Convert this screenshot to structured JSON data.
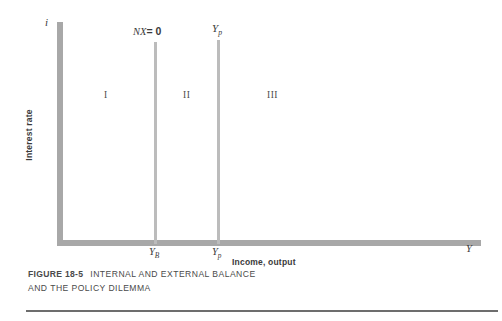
{
  "figure": {
    "number_label": "FIGURE 18-5",
    "caption_line1": "INTERNAL AND EXTERNAL BALANCE",
    "caption_line2": "AND THE POLICY DILEMMA"
  },
  "chart_data": {
    "type": "line",
    "title": "INTERNAL AND EXTERNAL BALANCE AND THE POLICY DILEMMA",
    "xlabel": "Income, output",
    "ylabel": "Interest rate",
    "x_axis_symbol": "Y",
    "y_axis_symbol": "i",
    "grid": false,
    "legend": "none",
    "annotations": [
      {
        "name": "nx-zero-label",
        "text": "NX = 0",
        "x_px": 154,
        "role": "vertical-schedule-label"
      },
      {
        "name": "potential-output-label-top",
        "text": "Yp",
        "x_px": 217,
        "role": "vertical-schedule-label"
      },
      {
        "name": "interest-rate-axis-symbol",
        "text": "i",
        "role": "axis-symbol"
      },
      {
        "name": "income-axis-symbol",
        "text": "Y",
        "role": "axis-symbol"
      }
    ],
    "vertical_lines": [
      {
        "name": "nx-zero-line",
        "label": "NX = 0",
        "x_tick": "YB",
        "x_px": 154
      },
      {
        "name": "potential-output-line",
        "label": "Yp",
        "x_tick": "Yp",
        "x_px": 217
      }
    ],
    "x_ticks": [
      {
        "label": "YB",
        "base": "Y",
        "sub": "B",
        "x_px": 154
      },
      {
        "label": "Yp",
        "base": "Y",
        "sub": "p",
        "x_px": 217
      }
    ],
    "regions": [
      {
        "name": "region-one",
        "label": "I",
        "x_px": 104
      },
      {
        "name": "region-two",
        "label": "II",
        "x_px": 183
      },
      {
        "name": "region-three",
        "label": "III",
        "x_px": 267
      }
    ],
    "colors": {
      "axis": "#a8a8a8",
      "schedule_line": "#bcbcbc",
      "text": "#3a3a3a",
      "rule": "#6d6d6d",
      "background": "#ffffff"
    }
  },
  "labels": {
    "i_symbol": "i",
    "nx_prefix": "NX",
    "nx_equals": "= 0",
    "yp_base": "Y",
    "yp_sub": "p",
    "yb_base": "Y",
    "yb_sub": "B",
    "y_symbol": "Y",
    "region_one": "I",
    "region_two": "II",
    "region_three": "III",
    "axis_y_title": "Interest rate",
    "axis_x_title": "Income, output"
  }
}
